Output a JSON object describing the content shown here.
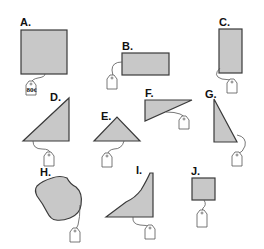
{
  "figure": {
    "items": [
      {
        "id": "A",
        "label": "A.",
        "shape": "square",
        "price_tag": "80¢"
      },
      {
        "id": "B",
        "label": "B.",
        "shape": "rectangle-horizontal",
        "price_tag": ""
      },
      {
        "id": "C",
        "label": "C.",
        "shape": "rectangle-vertical",
        "price_tag": ""
      },
      {
        "id": "D",
        "label": "D.",
        "shape": "right-triangle",
        "price_tag": ""
      },
      {
        "id": "E",
        "label": "E.",
        "shape": "isosceles-triangle",
        "price_tag": ""
      },
      {
        "id": "F",
        "label": "F.",
        "shape": "obtuse-triangle",
        "price_tag": ""
      },
      {
        "id": "G",
        "label": "G.",
        "shape": "right-triangle-tall",
        "price_tag": ""
      },
      {
        "id": "H",
        "label": "H.",
        "shape": "irregular-blob",
        "price_tag": ""
      },
      {
        "id": "I",
        "label": "I.",
        "shape": "curved-region",
        "price_tag": ""
      },
      {
        "id": "J",
        "label": "J.",
        "shape": "small-square",
        "price_tag": ""
      }
    ]
  },
  "colors": {
    "fill": "#c8c8c8",
    "stroke": "#3a3a3a"
  }
}
